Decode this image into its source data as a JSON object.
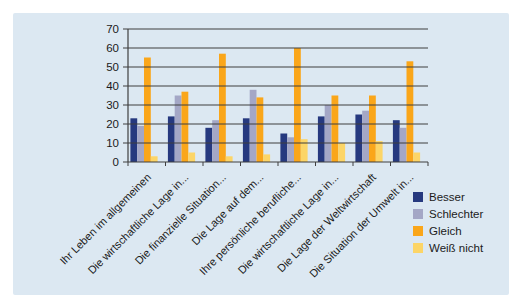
{
  "panel": {
    "background": "#dce8f2"
  },
  "chart_data": {
    "type": "bar",
    "title": "",
    "xlabel": "",
    "ylabel": "",
    "categories": [
      "Ihr Leben im allgemeinen",
      "Die wirtschaftliche Lage in...",
      "Die finanzielle Situation...",
      "Die Lage auf dem...",
      "Ihre persönliche berufliche...",
      "Die wirtschaftliche Lage in...",
      "Die Lage der Weltwirtschaft",
      "Die Situation der Umwelt in..."
    ],
    "series": [
      {
        "name": "Besser",
        "color": "#26397f",
        "values": [
          23,
          24,
          18,
          23,
          15,
          24,
          25,
          22
        ]
      },
      {
        "name": "Schlechter",
        "color": "#a4a7c6",
        "values": [
          19,
          35,
          22,
          38,
          13,
          30,
          27,
          18
        ]
      },
      {
        "name": "Gleich",
        "color": "#faa61a",
        "values": [
          55,
          37,
          57,
          34,
          60,
          35,
          35,
          53
        ]
      },
      {
        "name": "Weiß nicht",
        "color": "#fcd567",
        "values": [
          3,
          5,
          3,
          4,
          12,
          10,
          11,
          5
        ]
      }
    ],
    "ylim": [
      0,
      70
    ],
    "yticks": [
      0,
      10,
      20,
      30,
      40,
      50,
      60,
      70
    ],
    "grid": true,
    "gridlines_over_bars": true,
    "legend_position": "bottom-right",
    "axis_color": "#3f3f3f",
    "label_color": "#1a1a1a"
  }
}
